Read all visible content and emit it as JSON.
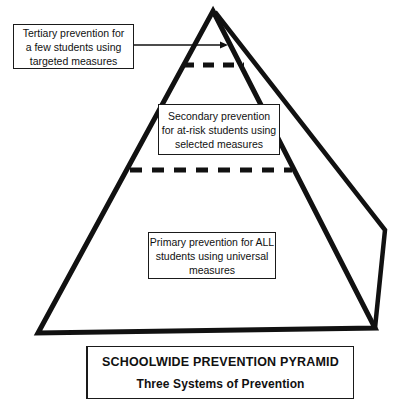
{
  "figure": {
    "background_color": "#ffffff",
    "ink_color": "#111111"
  },
  "pyramid": {
    "label": "three-tier prevention pyramid",
    "apex": {
      "x": 213,
      "y": 11
    },
    "front_base_left": {
      "x": 38,
      "y": 333
    },
    "front_base_right": {
      "x": 375,
      "y": 328
    },
    "back_right_vertex": {
      "x": 385,
      "y": 230
    },
    "tiers": [
      {
        "name": "tertiary",
        "divider_y": 65,
        "divider_style": "dashed"
      },
      {
        "name": "secondary",
        "divider_y": 170,
        "divider_style": "dashed"
      },
      {
        "name": "primary",
        "divider_y": null,
        "divider_style": "none"
      }
    ]
  },
  "callouts": {
    "tertiary": {
      "lines": [
        "Tertiary prevention for",
        "a few students using",
        "targeted measures"
      ]
    },
    "secondary": {
      "lines": [
        "Secondary prevention",
        "for at-risk students using",
        "selected measures"
      ]
    },
    "primary": {
      "lines": [
        "Primary prevention for ALL",
        "students using universal",
        "measures"
      ]
    }
  },
  "connector": {
    "name": "tertiary-arrow",
    "from": {
      "x": 133,
      "y": 45
    },
    "to": {
      "x": 228,
      "y": 45
    }
  },
  "caption": {
    "title": "SCHOOLWIDE PREVENTION PYRAMID",
    "subtitle": "Three Systems of Prevention"
  }
}
